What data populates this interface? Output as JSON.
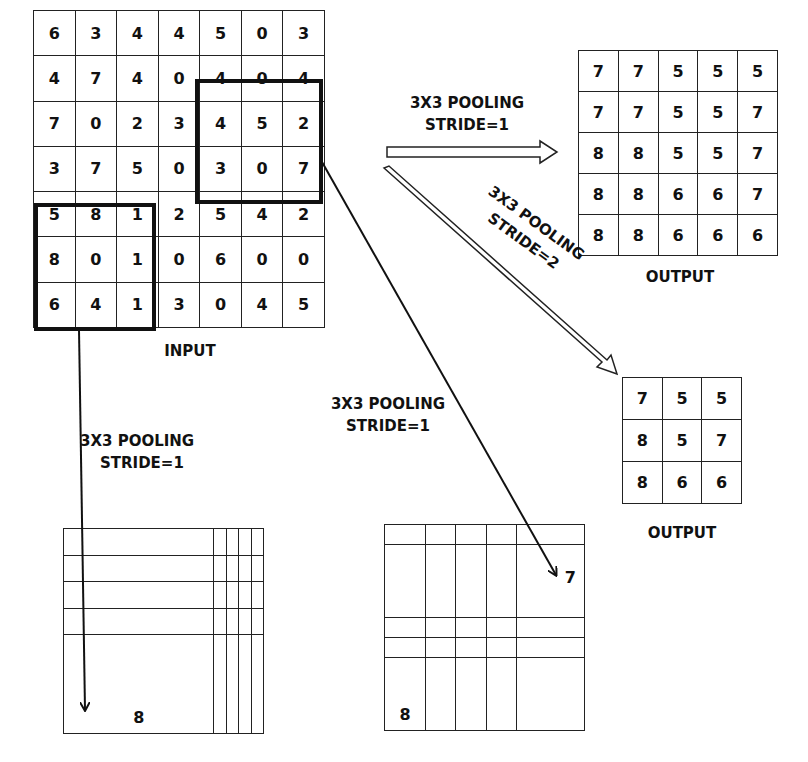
{
  "input": {
    "label": "INPUT",
    "rows": [
      [
        "6",
        "3",
        "4",
        "4",
        "5",
        "0",
        "3"
      ],
      [
        "4",
        "7",
        "4",
        "0",
        "4",
        "0",
        "4"
      ],
      [
        "7",
        "0",
        "2",
        "3",
        "4",
        "5",
        "2"
      ],
      [
        "3",
        "7",
        "5",
        "0",
        "3",
        "0",
        "7"
      ],
      [
        "5",
        "8",
        "1",
        "2",
        "5",
        "4",
        "2"
      ],
      [
        "8",
        "0",
        "1",
        "0",
        "6",
        "0",
        "0"
      ],
      [
        "6",
        "4",
        "1",
        "3",
        "0",
        "4",
        "5"
      ]
    ],
    "highlighted_windows": [
      {
        "rows": [
          1,
          3
        ],
        "cols": [
          4,
          6
        ]
      },
      {
        "rows": [
          4,
          6
        ],
        "cols": [
          0,
          2
        ]
      }
    ]
  },
  "arrows": {
    "stride1_right": {
      "line1": "3X3 POOLING",
      "line2": "STRIDE=1"
    },
    "stride2_diag": {
      "line1": "3X3 POOLING",
      "line2": "STRIDE=2"
    },
    "stride1_down": {
      "line1": "3X3 POOLING",
      "line2": "STRIDE=1"
    },
    "stride1_middle": {
      "line1": "3X3 POOLING",
      "line2": "STRIDE=1"
    }
  },
  "output_stride1": {
    "label": "OUTPUT",
    "rows": [
      [
        "7",
        "7",
        "5",
        "5",
        "5"
      ],
      [
        "7",
        "7",
        "5",
        "5",
        "7"
      ],
      [
        "8",
        "8",
        "5",
        "5",
        "7"
      ],
      [
        "8",
        "8",
        "6",
        "6",
        "7"
      ],
      [
        "8",
        "8",
        "6",
        "6",
        "6"
      ]
    ]
  },
  "output_stride2": {
    "label": "OUTPUT",
    "rows": [
      [
        "7",
        "5",
        "5"
      ],
      [
        "8",
        "5",
        "7"
      ],
      [
        "8",
        "6",
        "6"
      ]
    ]
  },
  "partial_left": {
    "rows": [
      [
        "",
        "",
        "",
        "",
        ""
      ],
      [
        "",
        "",
        "",
        "",
        ""
      ],
      [
        "",
        "",
        "",
        "",
        ""
      ],
      [
        "",
        "",
        "",
        "",
        ""
      ],
      [
        "8",
        "",
        "",
        "",
        ""
      ]
    ]
  },
  "partial_middle": {
    "rows": [
      [
        "",
        "",
        "",
        "",
        ""
      ],
      [
        "",
        "",
        "",
        "",
        "7"
      ],
      [
        "",
        "",
        "",
        "",
        ""
      ],
      [
        "",
        "",
        "",
        "",
        ""
      ],
      [
        "8",
        "",
        "",
        "",
        ""
      ]
    ]
  }
}
